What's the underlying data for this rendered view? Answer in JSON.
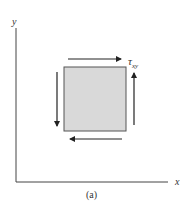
{
  "diagram": {
    "axes": {
      "x_label": "x",
      "y_label": "y"
    },
    "element": {
      "fill": "#d9d9d9",
      "stroke": "#555555"
    },
    "stress_label": {
      "symbol": "τ",
      "subscript": "xy"
    },
    "caption": "(a)",
    "arrows": [
      {
        "side": "top",
        "direction": "right"
      },
      {
        "side": "right",
        "direction": "up"
      },
      {
        "side": "bottom",
        "direction": "left"
      },
      {
        "side": "left",
        "direction": "down"
      }
    ]
  }
}
